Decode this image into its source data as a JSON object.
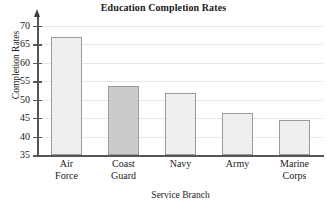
{
  "chart_data": {
    "type": "bar",
    "title": "Education Completion Rates",
    "xlabel": "Service Branch",
    "ylabel": "Completion Rates",
    "categories": [
      "Air\nForce",
      "Coast\nGuard",
      "Navy",
      "Army",
      "Marine\nCorps"
    ],
    "values": [
      67.0,
      53.8,
      51.7,
      46.5,
      44.4
    ],
    "ylim": [
      35,
      71
    ],
    "yticks": [
      35,
      40,
      45,
      50,
      55,
      60,
      65,
      70
    ],
    "ytick_labels": [
      "35",
      "40",
      "45",
      "50",
      "55",
      "60",
      "65",
      "70"
    ],
    "grid": true,
    "legend": "none",
    "bar_colors": [
      "#efefef",
      "#cbcbcb",
      "#efefef",
      "#efefef",
      "#efefef"
    ],
    "bar_edge_color": "#9a9a9a",
    "axis_color": "#555555",
    "grid_color": "#e6e6e6",
    "highlighted_category": "Coast Guard"
  }
}
